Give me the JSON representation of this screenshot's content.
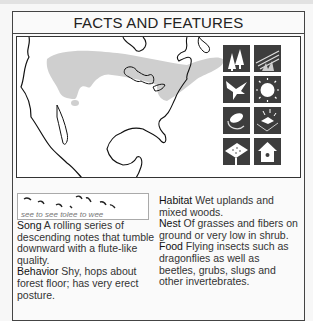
{
  "header": {
    "title": "FACTS AND FEATURES"
  },
  "map": {
    "label": "range-map-north-america",
    "range_color": "#cfcfcf",
    "outline_color": "#111111"
  },
  "icons": [
    {
      "name": "woodland-habitat-icon"
    },
    {
      "name": "grassland-sunrise-icon"
    },
    {
      "name": "flying-bird-icon"
    },
    {
      "name": "sun-icon"
    },
    {
      "name": "egg-nest-icon"
    },
    {
      "name": "ground-nest-icon"
    },
    {
      "name": "feeder-tray-icon"
    },
    {
      "name": "birdhouse-icon"
    }
  ],
  "song_box": {
    "caption": "see to see tolee to wee"
  },
  "facts_left": [
    {
      "label": "Song",
      "text": " A rolling series of descending notes that tumble downward with a flute-like quality."
    },
    {
      "label": "Behavior",
      "text": " Shy, hops about forest floor; has very erect posture."
    }
  ],
  "facts_right": [
    {
      "label": "Habitat",
      "text": " Wet uplands and mixed woods."
    },
    {
      "label": "Nest",
      "text": " Of grasses and fibers on ground or very low in shrub."
    },
    {
      "label": "Food",
      "text": " Flying insects such as dragonflies as well as beetles, grubs, slugs and other invertebrates."
    }
  ]
}
